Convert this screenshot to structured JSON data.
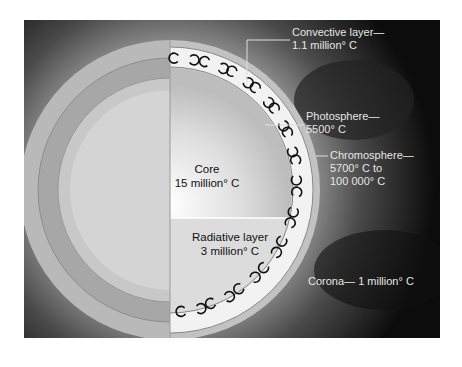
{
  "figure": {
    "colors": {
      "background": "#0a0a0a",
      "label_text": "#e6e6e6",
      "inner_text": "#111111",
      "frame_page": "#ffffff"
    },
    "labels": {
      "convective": {
        "line1": "Convective layer—",
        "line2": "1.1 million° C"
      },
      "photosphere": {
        "line1": "Photosphere—",
        "line2": "5500° C"
      },
      "chromosphere": {
        "line1": "Chromosphere—",
        "line2": "5700° C to",
        "line3": "100 000° C"
      },
      "corona": {
        "line1": "Corona— 1 million° C"
      },
      "core": {
        "line1": "Core",
        "line2": "15 million° C"
      },
      "radiative": {
        "line1": "Radiative layer",
        "line2": "3 million° C"
      }
    },
    "icons": [
      "convection-cell-icon"
    ]
  }
}
